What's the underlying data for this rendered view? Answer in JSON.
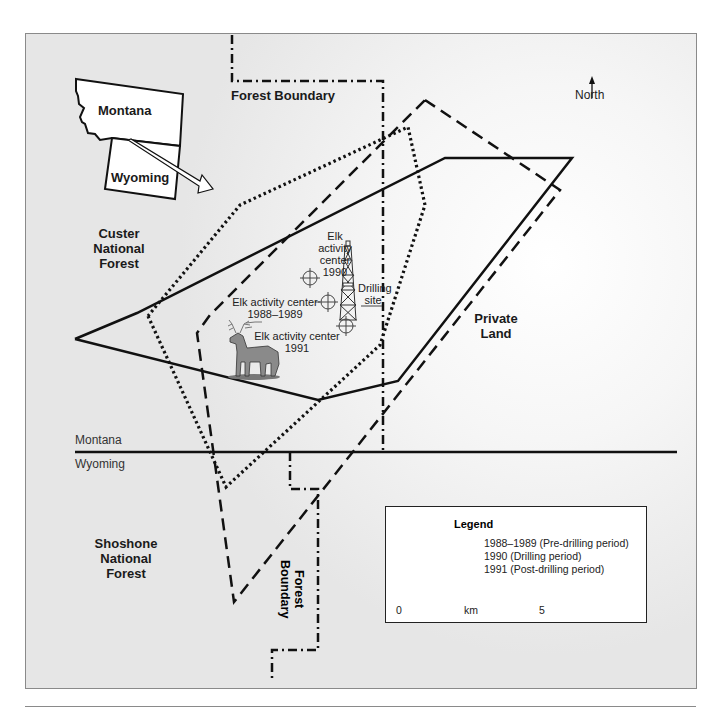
{
  "map": {
    "inset": {
      "states": [
        "Montana",
        "Wyoming"
      ]
    },
    "labels": {
      "forest_boundary_top": "Forest Boundary",
      "forest_boundary_bottom_line1": "Forest",
      "forest_boundary_bottom_line2": "Boundary",
      "north": "North",
      "custer_line1": "Custer",
      "custer_line2": "National",
      "custer_line3": "Forest",
      "shoshone_line1": "Shoshone",
      "shoshone_line2": "National",
      "shoshone_line3": "Forest",
      "private_line1": "Private",
      "private_line2": "Land",
      "state_line_north": "Montana",
      "state_line_south": "Wyoming",
      "elk_1990_line1": "Elk",
      "elk_1990_line2": "activity",
      "elk_1990_line3": "center",
      "elk_1990_line4": "1990",
      "elk_1988_line1": "Elk activity center",
      "elk_1988_line2": "1988–1989",
      "elk_1991_line1": "Elk activity center",
      "elk_1991_line2": "1991",
      "drilling_line1": "Drilling",
      "drilling_line2": "site"
    },
    "icons": {
      "north_arrow": "north-arrow-icon",
      "drilling_rig": "oil-derrick-icon",
      "elk": "elk-icon",
      "activity_center": "crosshair-icon"
    },
    "ranges": [
      {
        "period": "1988–1989",
        "style": "solid",
        "points": [
          [
            75,
            339
          ],
          [
            137,
            313
          ],
          [
            445,
            158
          ],
          [
            572,
            158
          ],
          [
            398,
            381
          ],
          [
            318,
            400
          ],
          [
            75,
            339
          ]
        ]
      },
      {
        "period": "1990",
        "style": "dotted",
        "points": [
          [
            148,
            316
          ],
          [
            226,
            487
          ],
          [
            380,
            345
          ],
          [
            425,
            205
          ],
          [
            408,
            127
          ],
          [
            240,
            205
          ],
          [
            148,
            316
          ]
        ]
      },
      {
        "period": "1991",
        "style": "dashed",
        "points": [
          [
            425,
            100
          ],
          [
            560,
            190
          ],
          [
            234,
            602
          ],
          [
            197,
            333
          ],
          [
            210,
            315
          ],
          [
            425,
            100
          ]
        ]
      }
    ],
    "colors": {
      "line": "#111111",
      "frame": "#8a8a8a",
      "background": "#eeeeee"
    }
  },
  "legend": {
    "title": "Legend",
    "items": [
      {
        "label": "1988–1989 (Pre-drilling period)",
        "style": "solid"
      },
      {
        "label": "1990 (Drilling period)",
        "style": "dotted"
      },
      {
        "label": "1991 (Post-drilling period)",
        "style": "dashed"
      }
    ],
    "scale": {
      "start": "0",
      "unit": "km",
      "end": "5"
    }
  }
}
